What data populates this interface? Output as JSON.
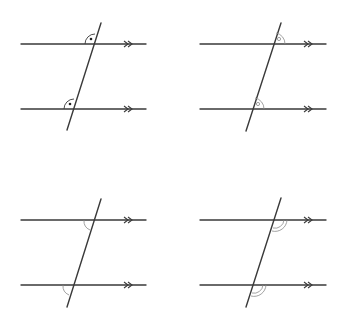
{
  "figure": {
    "colors": {
      "line": "#3a3a3a",
      "mark": "#3a3a3a",
      "mark_light": "#8a8a8a"
    },
    "panels": [
      {
        "id": "top-left",
        "angle_pair": "corresponding",
        "mark": "right-angle-dot",
        "position": "above-left of transversal"
      },
      {
        "id": "top-right",
        "angle_pair": "corresponding",
        "mark": "small-circle-arc",
        "position": "above-right of transversal"
      },
      {
        "id": "bottom-left",
        "angle_pair": "corresponding",
        "mark": "single-arc",
        "position": "below-left of transversal"
      },
      {
        "id": "bottom-right",
        "angle_pair": "corresponding",
        "mark": "double-arc",
        "position": "below-right of transversal"
      }
    ],
    "parallel_marker": "double-chevron"
  }
}
